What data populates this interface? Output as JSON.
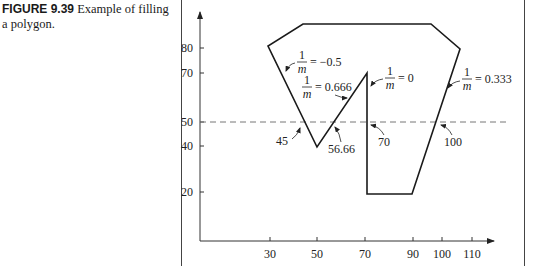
{
  "caption": {
    "figure_label": "FIGURE 9.39",
    "text_line1": "Example of filling",
    "text_line2": "a polygon."
  },
  "diagram": {
    "type": "polygon-scanline-fill",
    "y_ticks": [
      "80",
      "70",
      "50",
      "40",
      "20"
    ],
    "x_ticks": [
      "30",
      "50",
      "70",
      "90",
      "100",
      "110"
    ],
    "scanline_y": "50",
    "polygon_vertices": [
      [
        45,
        80
      ],
      [
        60,
        90
      ],
      [
        100,
        90
      ],
      [
        110,
        80
      ],
      [
        90,
        20
      ],
      [
        70,
        20
      ],
      [
        70,
        70
      ],
      [
        50,
        40
      ],
      [
        30,
        80
      ]
    ],
    "slope_labels": [
      {
        "num": "1",
        "den": "m",
        "value": "= −0.5"
      },
      {
        "num": "1",
        "den": "m",
        "value": "= 0.666"
      },
      {
        "num": "1",
        "den": "m",
        "value": "= 0"
      },
      {
        "num": "1",
        "den": "m",
        "value": "= 0.333"
      }
    ],
    "intersection_labels": [
      "45",
      "56.66",
      "70",
      "100"
    ]
  }
}
